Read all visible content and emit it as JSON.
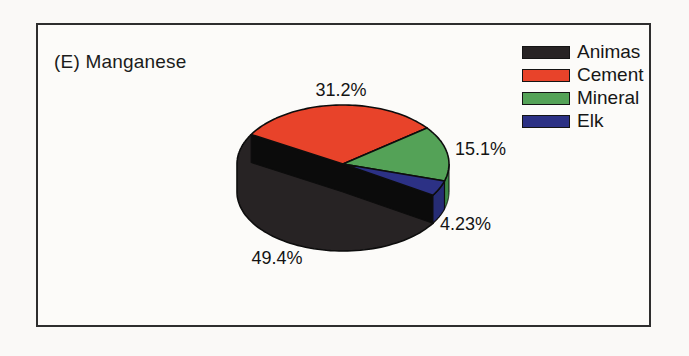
{
  "chart_data": {
    "type": "pie",
    "style": "3d-extruded",
    "title": "(E) Manganese",
    "legend_position": "top-right",
    "start_angle_deg": 150,
    "direction": "clockwise",
    "draw_order": [
      "Cement",
      "Mineral",
      "Elk",
      "Animas"
    ],
    "slices": [
      {
        "label": "Animas",
        "value": 49.4,
        "pct_label": "49.4%",
        "color": "#272324"
      },
      {
        "label": "Cement",
        "value": 31.2,
        "pct_label": "31.2%",
        "color": "#e8432a"
      },
      {
        "label": "Mineral",
        "value": 15.1,
        "pct_label": "15.1%",
        "color": "#54a257"
      },
      {
        "label": "Elk",
        "value": 4.23,
        "pct_label": "4.23%",
        "color": "#2c3185"
      }
    ],
    "colors": {
      "outline": "#0d0d0d",
      "shadow_band": "#0b0b0b",
      "elk_side": "#262c74",
      "mineral_side": "#3f8a47",
      "frame_border": "#2e2e2e",
      "background": "#fcfbf9"
    }
  }
}
